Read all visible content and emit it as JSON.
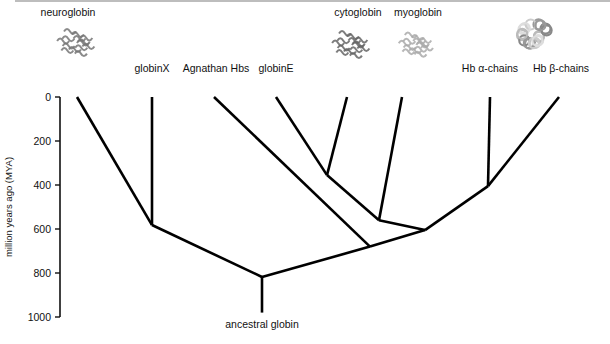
{
  "axis": {
    "label": "million years ago (MYA)",
    "ticks": [
      0,
      200,
      400,
      600,
      800,
      1000
    ],
    "range": [
      0,
      1000
    ]
  },
  "leaves": [
    {
      "id": "neuroglobin",
      "label": "neuroglobin",
      "has_structure_image": true
    },
    {
      "id": "globinX",
      "label": "globinX",
      "has_structure_image": false
    },
    {
      "id": "agnathan",
      "label": "Agnathan Hbs",
      "has_structure_image": false
    },
    {
      "id": "globinE",
      "label": "globinE",
      "has_structure_image": false
    },
    {
      "id": "cytoglobin",
      "label": "cytoglobin",
      "has_structure_image": true
    },
    {
      "id": "myoglobin",
      "label": "myoglobin",
      "has_structure_image": true
    },
    {
      "id": "hba",
      "label": "Hb α-chains",
      "has_structure_image": false
    },
    {
      "id": "hbb",
      "label": "Hb β-chains",
      "has_structure_image": false
    }
  ],
  "hemoglobin_structure_image": true,
  "root_label": "ancestral globin",
  "nodes_mya": {
    "root": 818,
    "neuro_globinX": 582,
    "agnathan_split": 680,
    "vertebrate_core": 605,
    "cyto_myo_split": 560,
    "globinE_cyto": 355,
    "hb_alpha_beta": 405,
    "root_stem_end": 980
  }
}
